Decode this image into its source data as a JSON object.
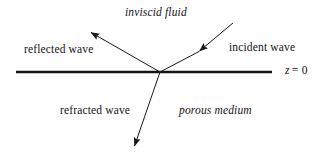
{
  "figure": {
    "background_color": "#fefefe",
    "stroke_color": "#1a1a1a",
    "labels": {
      "upper_medium": "inviscid fluid",
      "lower_medium": "porous medium",
      "incident": "incident wave",
      "reflected": "reflected wave",
      "refracted": "refracted wave",
      "interface": "z = 0",
      "interface_variable": "z",
      "interface_relation": "= 0"
    },
    "geometry": {
      "interface_line": {
        "x1": 16,
        "y1": 72,
        "x2": 272,
        "y2": 72,
        "width": 2.2
      },
      "junction": {
        "x": 160,
        "y": 72
      },
      "incident_ray": {
        "x1": 232,
        "y1": 24,
        "x2": 198,
        "y2": 52,
        "arrow_at": "end"
      },
      "reflected_ray": {
        "x1": 160,
        "y1": 72,
        "x2": 90,
        "y2": 32,
        "arrow_at": "end"
      },
      "refracted_ray": {
        "x1": 160,
        "y1": 72,
        "x2": 134,
        "y2": 147,
        "arrow_at": "end"
      }
    }
  }
}
